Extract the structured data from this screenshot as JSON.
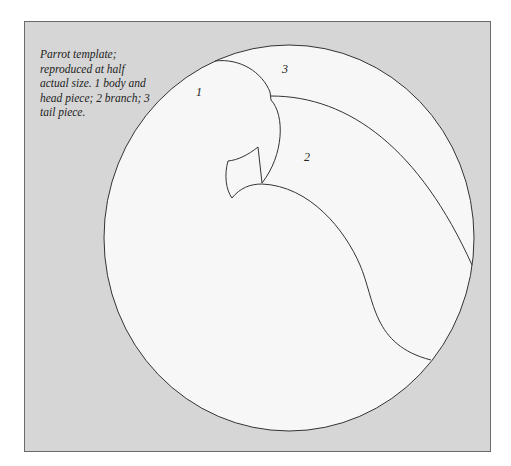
{
  "caption": "Parrot template; reproduced at half actual size. 1 body and head piece; 2 branch; 3 tail piece.",
  "labels": {
    "piece1": "1",
    "piece2": "2",
    "piece3": "3"
  },
  "colors": {
    "background": "#d6d6d6",
    "circle_fill": "#f7f7f7",
    "line": "#333333"
  }
}
